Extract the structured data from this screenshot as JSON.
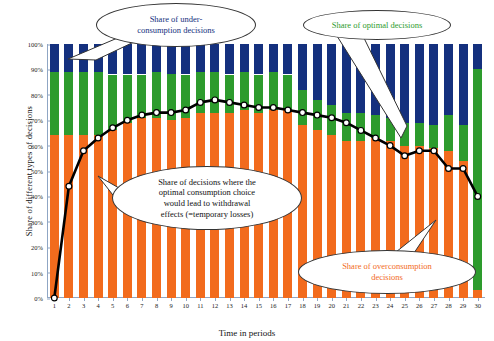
{
  "chart_data": {
    "type": "bar",
    "title": "",
    "xlabel": "Time in periods",
    "ylabel": "Share of different types of decisions",
    "ylim": [
      0,
      100
    ],
    "ytick_labels": [
      "0%",
      "10%",
      "20%",
      "30%",
      "40%",
      "50%",
      "60%",
      "70%",
      "80%",
      "90%",
      "100%"
    ],
    "ytick_values": [
      0,
      10,
      20,
      30,
      40,
      50,
      60,
      70,
      80,
      90,
      100
    ],
    "grid": false,
    "legend_position": "callouts",
    "categories": [
      1,
      2,
      3,
      4,
      5,
      6,
      7,
      8,
      9,
      10,
      11,
      12,
      13,
      14,
      15,
      16,
      17,
      18,
      19,
      20,
      21,
      22,
      23,
      24,
      25,
      26,
      27,
      28,
      29,
      30
    ],
    "series": [
      {
        "name": "Share of overconsumption decisions",
        "color": "#f26b1d",
        "values": [
          64,
          64,
          64,
          64,
          66,
          69,
          71,
          71,
          70,
          71,
          73,
          73,
          73,
          74,
          73,
          74,
          74,
          68,
          66,
          64,
          62,
          62,
          63,
          62,
          60,
          60,
          59,
          58,
          54,
          3
        ]
      },
      {
        "name": "Share of optimal decisions",
        "color": "#2d9b2d",
        "values": [
          25,
          25,
          25,
          25,
          22,
          19,
          17,
          18,
          18,
          17,
          16,
          16,
          15,
          15,
          15,
          15,
          14,
          14,
          12,
          12,
          11,
          11,
          9,
          9,
          9,
          9,
          9,
          14,
          14,
          87
        ]
      },
      {
        "name": "Share of under-consumption decisions",
        "color": "#14307e",
        "values": [
          11,
          11,
          11,
          11,
          12,
          12,
          12,
          11,
          12,
          12,
          11,
          11,
          12,
          11,
          12,
          11,
          12,
          18,
          22,
          24,
          27,
          27,
          28,
          29,
          31,
          31,
          32,
          28,
          32,
          10
        ]
      }
    ],
    "line_series": {
      "name": "Share of decisions where the optimal consumption choice would lead to withdrawal effects (=temporary losses)",
      "color": "#000000",
      "marker": "circle-white-fill",
      "values": [
        0,
        44,
        58,
        63,
        67,
        70,
        72,
        73,
        73,
        74,
        77,
        78,
        77,
        76,
        75,
        75,
        74,
        73,
        72,
        71,
        69,
        66,
        63,
        60,
        56,
        58,
        58,
        51,
        51,
        40
      ]
    },
    "callouts": [
      {
        "id": "under",
        "text": "Share of under-consumption decisions",
        "color": "#14307e",
        "lines": [
          "Share of under-",
          "consumption decisions"
        ]
      },
      {
        "id": "optimal",
        "text": "Share of optimal decisions",
        "color": "#2d9b2d",
        "lines": [
          "Share of optimal decisions"
        ]
      },
      {
        "id": "withdrawal",
        "text": "Share of decisions where the optimal consumption choice would lead to withdrawal effects (=temporary losses)",
        "color": "#111111",
        "lines": [
          "Share of decisions where the",
          "optimal consumption choice",
          "would lead to withdrawal",
          "effects (=temporary losses)"
        ]
      },
      {
        "id": "overconsumption",
        "text": "Share of overconsumption decisions",
        "color": "#f26b1d",
        "lines": [
          "Share of overconsumption",
          "decisions"
        ]
      }
    ]
  },
  "axes": {
    "y_title": "Share of different types of decisions",
    "x_title": "Time in periods"
  }
}
